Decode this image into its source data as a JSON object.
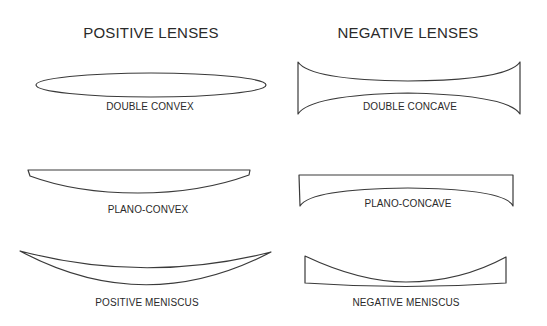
{
  "columns": {
    "positive": {
      "heading": "POSITIVE LENSES",
      "lenses": [
        {
          "type": "double-convex",
          "label": "DOUBLE CONVEX"
        },
        {
          "type": "plano-convex",
          "label": "PLANO-CONVEX"
        },
        {
          "type": "positive-meniscus",
          "label": "POSITIVE MENISCUS"
        }
      ]
    },
    "negative": {
      "heading": "NEGATIVE LENSES",
      "lenses": [
        {
          "type": "double-concave",
          "label": "DOUBLE CONCAVE"
        },
        {
          "type": "plano-concave",
          "label": "PLANO-CONCAVE"
        },
        {
          "type": "negative-meniscus",
          "label": "NEGATIVE MENISCUS"
        }
      ]
    }
  },
  "colors": {
    "stroke": "#3a3a3a",
    "text": "#2a2a2a",
    "background": "#ffffff"
  }
}
